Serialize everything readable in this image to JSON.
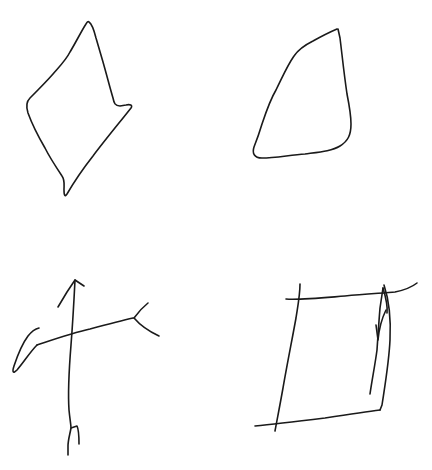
{
  "canvas": {
    "width": 432,
    "height": 470,
    "background": "#ffffff",
    "ink_color": "#1a1a1a",
    "stroke_width": 1.6
  },
  "sketches": [
    {
      "id": "kite-diamond",
      "label": "Hand-drawn diamond / kite shape",
      "position": "top-left"
    },
    {
      "id": "rounded-triangle",
      "label": "Hand-drawn rounded triangle",
      "position": "top-right"
    },
    {
      "id": "stick-figure-cross",
      "label": "Hand-drawn cross / stick figure with arrow head",
      "position": "bottom-left"
    },
    {
      "id": "square-with-arrow",
      "label": "Hand-drawn square with extended edges and inner arrow",
      "position": "bottom-right"
    }
  ]
}
